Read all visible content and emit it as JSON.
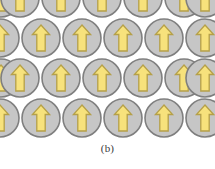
{
  "figure": {
    "caption": "(b)",
    "panel_label": "(b)",
    "width": 215,
    "height": 169
  },
  "colors": {
    "background": "#ffffff",
    "circle_fill": "#c6c6c6",
    "circle_stroke": "#7f7f7f",
    "arrow_fill": "#f7e27c",
    "arrow_stroke": "#b5a049",
    "caption_text": "#3a3a3a"
  },
  "grid": {
    "circle_radius": 19,
    "column_spacing": 41,
    "row_spacing": 40,
    "panel_height": 138,
    "rows": [
      {
        "name": "row-1",
        "cy": -2,
        "clipped": "top",
        "centers_x": [
          1,
          20,
          61,
          102,
          143,
          184,
          205
        ]
      },
      {
        "name": "row-2",
        "cy": 38,
        "clipped": "right",
        "centers_x": [
          0,
          41,
          82,
          123,
          164,
          205
        ]
      },
      {
        "name": "row-3",
        "cy": 78,
        "clipped": "left",
        "centers_x": [
          1,
          20,
          61,
          102,
          143,
          184,
          205
        ]
      },
      {
        "name": "row-4",
        "cy": 118,
        "clipped": "bottom",
        "centers_x": [
          0,
          41,
          82,
          123,
          164,
          205
        ]
      }
    ]
  },
  "arrow": {
    "direction": "up",
    "orientation_degrees": 90,
    "shaft_half_width": 4.2,
    "head_half_width": 8.6,
    "head_height": 9.5,
    "total_height": 26
  }
}
